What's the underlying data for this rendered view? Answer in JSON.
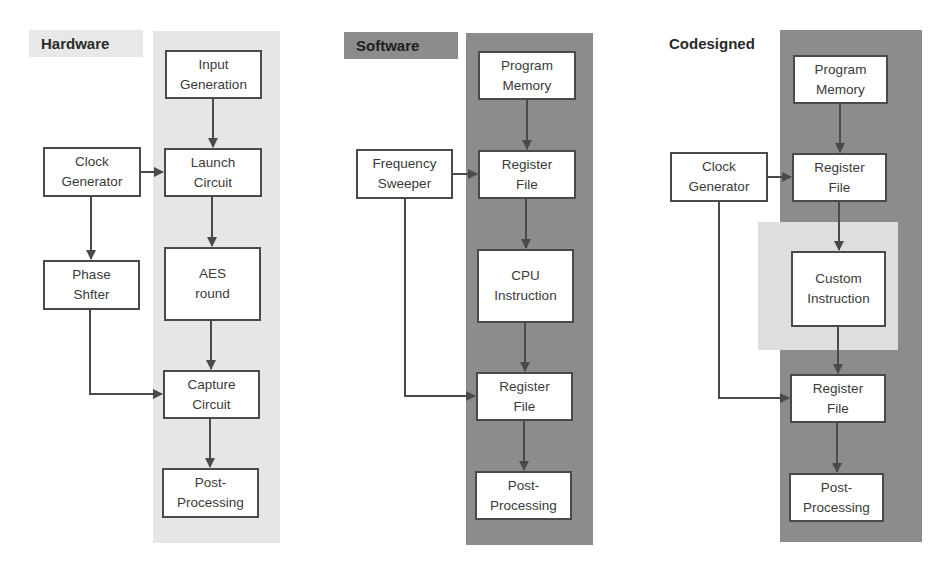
{
  "colors": {
    "hardware_panel": "#e6e6e6",
    "software_panel": "#8c8c8c",
    "custom_highlight": "#dedede",
    "node_fill": "#ffffff",
    "node_border": "#4a4a4a",
    "arrow": "#4a4a4a"
  },
  "hardware": {
    "title": "Hardware",
    "nodes": {
      "input_generation": "Input\nGeneration",
      "launch_circuit": "Launch\nCircuit",
      "aes_round": "AES\nround",
      "capture_circuit": "Capture\nCircuit",
      "post_processing": "Post-\nProcessing",
      "clock_generator": "Clock\nGenerator",
      "phase_shifter": "Phase\nShfter"
    }
  },
  "software": {
    "title": "Software",
    "nodes": {
      "program_memory": "Program\nMemory",
      "register_file_1": "Register\nFile",
      "cpu_instruction": "CPU\nInstruction",
      "register_file_2": "Register\nFile",
      "post_processing": "Post-\nProcessing",
      "frequency_sweeper": "Frequency\nSweeper"
    }
  },
  "codesigned": {
    "title": "Codesigned",
    "nodes": {
      "program_memory": "Program\nMemory",
      "register_file_1": "Register\nFile",
      "custom_instruction": "Custom\nInstruction",
      "register_file_2": "Register\nFile",
      "post_processing": "Post-\nProcessing",
      "clock_generator": "Clock\nGenerator"
    }
  },
  "edges": [
    {
      "from": "hardware.input_generation",
      "to": "hardware.launch_circuit"
    },
    {
      "from": "hardware.clock_generator",
      "to": "hardware.launch_circuit"
    },
    {
      "from": "hardware.clock_generator",
      "to": "hardware.phase_shifter"
    },
    {
      "from": "hardware.launch_circuit",
      "to": "hardware.aes_round"
    },
    {
      "from": "hardware.aes_round",
      "to": "hardware.capture_circuit"
    },
    {
      "from": "hardware.phase_shifter",
      "to": "hardware.capture_circuit"
    },
    {
      "from": "hardware.capture_circuit",
      "to": "hardware.post_processing"
    },
    {
      "from": "software.program_memory",
      "to": "software.register_file_1"
    },
    {
      "from": "software.frequency_sweeper",
      "to": "software.register_file_1"
    },
    {
      "from": "software.register_file_1",
      "to": "software.cpu_instruction"
    },
    {
      "from": "software.cpu_instruction",
      "to": "software.register_file_2"
    },
    {
      "from": "software.frequency_sweeper",
      "to": "software.register_file_2"
    },
    {
      "from": "software.register_file_2",
      "to": "software.post_processing"
    },
    {
      "from": "codesigned.program_memory",
      "to": "codesigned.register_file_1"
    },
    {
      "from": "codesigned.clock_generator",
      "to": "codesigned.register_file_1"
    },
    {
      "from": "codesigned.register_file_1",
      "to": "codesigned.custom_instruction"
    },
    {
      "from": "codesigned.custom_instruction",
      "to": "codesigned.register_file_2"
    },
    {
      "from": "codesigned.clock_generator",
      "to": "codesigned.register_file_2"
    },
    {
      "from": "codesigned.register_file_2",
      "to": "codesigned.post_processing"
    }
  ]
}
